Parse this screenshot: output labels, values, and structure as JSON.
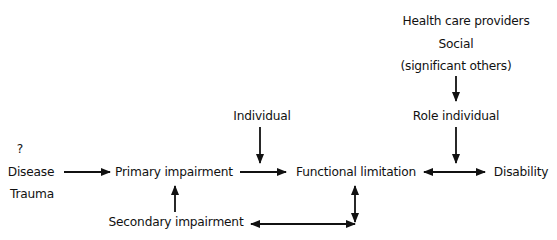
{
  "diagram": {
    "type": "flow",
    "nodes": {
      "question_mark": "?",
      "disease": "Disease",
      "trauma": "Trauma",
      "primary_impairment": "Primary impairment",
      "secondary_impairment": "Secondary impairment",
      "individual": "Individual",
      "functional_limitation": "Functional limitation",
      "disability": "Disability",
      "health_care_providers": "Health care providers",
      "social": "Social",
      "significant_others": "(significant others)",
      "role_individual": "Role individual"
    },
    "edges": [
      {
        "from": "Disease/Trauma",
        "to": "Primary impairment",
        "direction": "forward"
      },
      {
        "from": "Primary impairment",
        "to": "Functional limitation",
        "direction": "forward"
      },
      {
        "from": "Individual",
        "to": "Primary impairment→Functional limitation",
        "direction": "forward"
      },
      {
        "from": "Secondary impairment",
        "to": "Primary impairment",
        "direction": "forward"
      },
      {
        "from": "Secondary impairment",
        "to": "Functional limitation",
        "direction": "bidirectional"
      },
      {
        "from": "Functional limitation",
        "to": "Disability",
        "direction": "bidirectional"
      },
      {
        "from": "Health care providers / Social (significant others)",
        "to": "Role individual",
        "direction": "forward"
      },
      {
        "from": "Role individual",
        "to": "Functional limitation↔Disability",
        "direction": "forward"
      }
    ],
    "colors": {
      "line": "#111111",
      "background": "#ffffff"
    }
  }
}
